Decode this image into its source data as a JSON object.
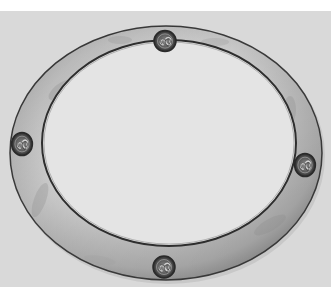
{
  "image": {
    "subject": "Oval hammered metal mirror frame with four Celtic triskele knot bosses",
    "alt": "Black-and-white photograph of an oval metal frame with decorative circular knot medallions at top, bottom, left and right",
    "colors": {
      "page_margin": "#ffffff",
      "backdrop": "#d9d9d9",
      "frame_light": "#dcdcdc",
      "frame_mid": "#b8b8b8",
      "frame_dark": "#555555",
      "frame_edge": "#2e2e2e",
      "mirror_glass": "#e4e4e4",
      "knot_dark": "#333333",
      "knot_light": "#9a9a9a"
    },
    "ornaments": [
      {
        "position": "top",
        "type": "triskele-knot"
      },
      {
        "position": "left",
        "type": "triskele-knot"
      },
      {
        "position": "right",
        "type": "triskele-knot"
      },
      {
        "position": "bottom",
        "type": "triskele-knot"
      }
    ]
  }
}
